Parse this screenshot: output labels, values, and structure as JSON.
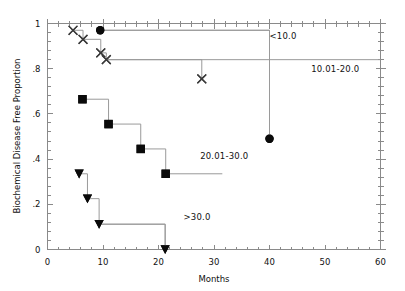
{
  "chart_data": {
    "type": "line",
    "title": "",
    "xlabel": "Months",
    "ylabel": "Biochemical Disease Free Proportion",
    "xlim": [
      0,
      60
    ],
    "ylim": [
      0,
      1
    ],
    "grid": false,
    "legend_position": "inline-annotations",
    "x_ticks": [
      "0",
      "10",
      "20",
      "30",
      "40",
      "50",
      "60"
    ],
    "x_tick_values": [
      0,
      10,
      20,
      30,
      40,
      50,
      60
    ],
    "y_ticks": [
      "0",
      ".2",
      ".4",
      ".6",
      ".8",
      "1"
    ],
    "y_tick_values": [
      0,
      0.2,
      0.4,
      0.6,
      0.8,
      1
    ],
    "series": [
      {
        "name": "<10.0",
        "label": "<10.0",
        "marker": "circle",
        "points": [
          {
            "x": 9.5,
            "y": 0.97
          },
          {
            "x": 40.0,
            "y": 0.49
          }
        ]
      },
      {
        "name": "10.01-20.0",
        "label": "10.01-20.0",
        "marker": "x-cross",
        "points": [
          {
            "x": 4.6,
            "y": 0.97
          },
          {
            "x": 6.4,
            "y": 0.93
          },
          {
            "x": 9.6,
            "y": 0.87
          },
          {
            "x": 10.6,
            "y": 0.84
          },
          {
            "x": 27.8,
            "y": 0.755
          }
        ]
      },
      {
        "name": "20.01-30.0",
        "label": "20.01-30.0",
        "marker": "square",
        "points": [
          {
            "x": 6.3,
            "y": 0.665
          },
          {
            "x": 11.0,
            "y": 0.555
          },
          {
            "x": 16.8,
            "y": 0.445
          },
          {
            "x": 21.3,
            "y": 0.335
          }
        ]
      },
      {
        "name": ">30.0",
        "label": ">30.0",
        "marker": "triangle-down",
        "points": [
          {
            "x": 5.7,
            "y": 0.335
          },
          {
            "x": 7.2,
            "y": 0.225
          },
          {
            "x": 9.3,
            "y": 0.112
          },
          {
            "x": 21.2,
            "y": 0.0
          }
        ]
      }
    ],
    "annotations": [
      {
        "text": "<10.0",
        "x": 40.0,
        "y": 0.945
      },
      {
        "text": "10.01-20.0",
        "x": 47.5,
        "y": 0.8
      },
      {
        "text": "20.01-30.0",
        "x": 27.5,
        "y": 0.415
      },
      {
        "text": ">30.0",
        "x": 24.5,
        "y": 0.145
      }
    ]
  },
  "axes": {
    "x_label": "Months",
    "y_label": "Biochemical Disease Free Proportion"
  }
}
